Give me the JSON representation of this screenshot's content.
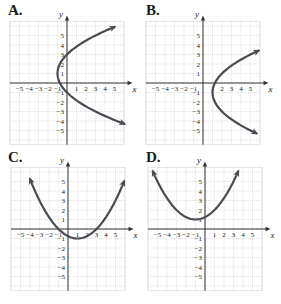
{
  "chart_data": [
    {
      "type": "line",
      "label": "A.",
      "title": "A.",
      "xlabel": "x",
      "ylabel": "y",
      "xlim": [
        -6,
        6
      ],
      "ylim": [
        -6,
        6
      ],
      "xticks": [
        "-5",
        "-4",
        "-3",
        "-2",
        "-1",
        "1",
        "2",
        "3",
        "4",
        "5"
      ],
      "yticks": [
        "5",
        "4",
        "3",
        "2",
        "1",
        "-1",
        "-2",
        "-3",
        "-4",
        "-5"
      ],
      "grid": true,
      "orientation": "horizontal",
      "equation": "x = (y - 1)^2 / 4 - 1",
      "vertex": [
        -1,
        1
      ],
      "h": -1,
      "k": 1,
      "a": 0.25,
      "t_range": [
        -4.3,
        5.9
      ]
    },
    {
      "type": "line",
      "label": "B.",
      "title": "B.",
      "xlabel": "x",
      "ylabel": "y",
      "xlim": [
        -6,
        6
      ],
      "ylim": [
        -6,
        6
      ],
      "xticks": [
        "-5",
        "-4",
        "-3",
        "-2",
        "-1",
        "1",
        "2",
        "3",
        "4",
        "5"
      ],
      "yticks": [
        "5",
        "4",
        "3",
        "2",
        "1",
        "-1",
        "-2",
        "-3",
        "-4",
        "-5"
      ],
      "grid": true,
      "orientation": "horizontal",
      "equation": "x = (y + 1)^2 / 4 + 1",
      "vertex": [
        1,
        -1
      ],
      "h": 1,
      "k": -1,
      "a": 0.25,
      "t_range": [
        -5.3,
        3.4
      ]
    },
    {
      "type": "line",
      "label": "C.",
      "title": "C.",
      "xlabel": "x",
      "ylabel": "y",
      "xlim": [
        -6,
        6
      ],
      "ylim": [
        -6,
        6
      ],
      "xticks": [
        "-5",
        "-4",
        "-3",
        "-2",
        "-1",
        "1",
        "2",
        "3",
        "4",
        "5"
      ],
      "yticks": [
        "5",
        "4",
        "3",
        "2",
        "1",
        "-1",
        "-2",
        "-3",
        "-4",
        "-5"
      ],
      "grid": true,
      "orientation": "vertical",
      "equation": "y = (x - 1)^2 / 4 - 1",
      "vertex": [
        1,
        -1
      ],
      "h": 1,
      "k": -1,
      "a": 0.25,
      "t_range": [
        -4.0,
        5.9
      ]
    },
    {
      "type": "line",
      "label": "D.",
      "title": "D.",
      "xlabel": "x",
      "ylabel": "y",
      "xlim": [
        -6,
        6
      ],
      "ylim": [
        -6,
        6
      ],
      "xticks": [
        "-5",
        "-4",
        "-3",
        "-2",
        "-1",
        "1",
        "2",
        "3",
        "4",
        "5"
      ],
      "yticks": [
        "5",
        "4",
        "3",
        "2",
        "1",
        "-1",
        "-2",
        "-3",
        "-4",
        "-5"
      ],
      "grid": true,
      "orientation": "vertical",
      "equation": "y = (x + 1)^2 / 4 + 1",
      "vertex": [
        -1,
        1
      ],
      "h": -1,
      "k": 1,
      "a": 0.25,
      "t_range": [
        -5.5,
        3.5
      ]
    }
  ],
  "panels": [
    {
      "label": "A.",
      "x_axis_label": "x",
      "y_axis_label": "y"
    },
    {
      "label": "B.",
      "x_axis_label": "x",
      "y_axis_label": "y"
    },
    {
      "label": "C.",
      "x_axis_label": "x",
      "y_axis_label": "y"
    },
    {
      "label": "D.",
      "x_axis_label": "x",
      "y_axis_label": "y"
    }
  ],
  "colors": {
    "curve": "#4a4a52",
    "axis": "#333333",
    "grid": "#d4d4d4",
    "text": "#222222"
  }
}
